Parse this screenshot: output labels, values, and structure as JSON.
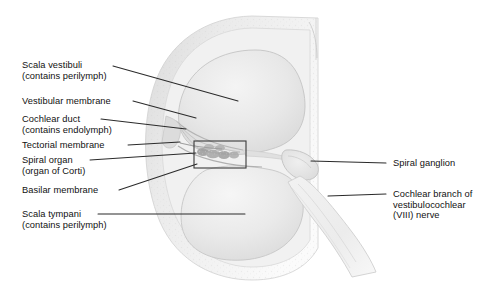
{
  "figure": {
    "style": "grayscale anatomical illustration",
    "width": 499,
    "height": 293,
    "background_color": "#ffffff",
    "text_color": "#111111",
    "leader_color": "#2b2b2b"
  },
  "labels_left": [
    {
      "name": "scala-vestibuli",
      "lines": [
        "Scala vestibuli",
        "(contains perilymph)"
      ],
      "x": 22,
      "y": 60,
      "leader": {
        "x1": 113,
        "y1": 66,
        "x2": 238,
        "y2": 101
      }
    },
    {
      "name": "vestibular-membrane",
      "lines": [
        "Vestibular membrane"
      ],
      "x": 22,
      "y": 96,
      "leader": {
        "x1": 133,
        "y1": 101,
        "x2": 196,
        "y2": 118
      }
    },
    {
      "name": "cochlear-duct",
      "lines": [
        "Cochlear duct",
        "(contains endolymph)"
      ],
      "x": 22,
      "y": 114,
      "leader": {
        "x1": 101,
        "y1": 119,
        "x2": 186,
        "y2": 129
      }
    },
    {
      "name": "tectorial-membrane",
      "lines": [
        "Tectorial membrane"
      ],
      "x": 22,
      "y": 140,
      "leader": {
        "x1": 128,
        "y1": 145,
        "x2": 180,
        "y2": 142
      }
    },
    {
      "name": "spiral-organ",
      "lines": [
        "Spiral organ",
        "(organ of Corti)"
      ],
      "x": 22,
      "y": 155,
      "leader": {
        "x1": 90,
        "y1": 160,
        "x2": 196,
        "y2": 153
      }
    },
    {
      "name": "basilar-membrane",
      "lines": [
        "Basilar membrane"
      ],
      "x": 22,
      "y": 185,
      "leader": {
        "x1": 119,
        "y1": 190,
        "x2": 197,
        "y2": 164
      }
    },
    {
      "name": "scala-tympani",
      "lines": [
        "Scala tympani",
        "(contains perilymph)"
      ],
      "x": 22,
      "y": 209,
      "leader": {
        "x1": 98,
        "y1": 214,
        "x2": 245,
        "y2": 214
      }
    }
  ],
  "labels_right": [
    {
      "name": "spiral-ganglion",
      "lines": [
        "Spiral ganglion"
      ],
      "x": 393,
      "y": 158,
      "leader": {
        "x1": 386,
        "y1": 163,
        "x2": 311,
        "y2": 161
      }
    },
    {
      "name": "cochlear-branch-nerve",
      "lines": [
        "Cochlear branch of",
        "vestibulocochlear",
        "(VIII) nerve"
      ],
      "x": 393,
      "y": 189,
      "leader": {
        "x1": 386,
        "y1": 194,
        "x2": 328,
        "y2": 196
      }
    }
  ],
  "detail_box": {
    "name": "organ-of-corti-detail-box",
    "x": 194,
    "y": 141,
    "width": 52,
    "height": 27,
    "stroke": "#3a3a3a"
  },
  "anatomy_regions": [
    {
      "name": "scala-vestibuli-chamber",
      "fill": "#e6e6e6"
    },
    {
      "name": "scala-tympani-chamber",
      "fill": "#e9e9e9"
    },
    {
      "name": "cochlear-duct-chamber",
      "fill": "#dedede"
    },
    {
      "name": "bony-wall",
      "fill": "#ededed"
    },
    {
      "name": "spiral-ganglion-body",
      "fill": "#e4e4e4"
    },
    {
      "name": "nerve-trunk",
      "fill": "#f0f0f0"
    }
  ]
}
